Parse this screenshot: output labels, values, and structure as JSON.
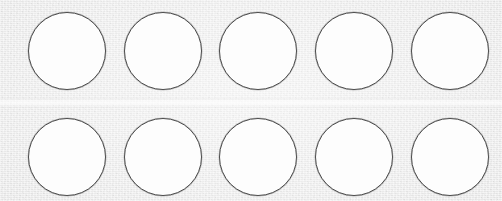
{
  "canvas": {
    "width": 502,
    "height": 201,
    "background_color": "#e2e2e2",
    "medium": "scanned-paper",
    "visible_text": ""
  },
  "sheet": {
    "name": "bubble-grid-sheet",
    "description": "blank answer-sheet bubble grid",
    "rows": 2,
    "columns": 5,
    "bubble_count": 10
  },
  "bubble_style": {
    "diameter": 78,
    "fill_color": "#fdfdfd",
    "stroke_color": "#4c4c4c",
    "stroke_width": 1,
    "filled": false,
    "state": "empty"
  },
  "layout": {
    "column_x": [
      28,
      124,
      219,
      315,
      411
    ],
    "row_y": [
      12,
      118
    ],
    "column_pitch": 96,
    "row_pitch": 106
  },
  "artifacts": {
    "crease": {
      "name": "paper-crease",
      "orientation": "horizontal",
      "y": 98,
      "height": 10
    }
  },
  "grid": {
    "rows": [
      {
        "index": 1,
        "y": 12,
        "bubbles": [
          {
            "id": "r1c1",
            "x": 28,
            "label": "row 1 bubble 1",
            "filled": false
          },
          {
            "id": "r1c2",
            "x": 124,
            "label": "row 1 bubble 2",
            "filled": false
          },
          {
            "id": "r1c3",
            "x": 219,
            "label": "row 1 bubble 3",
            "filled": false
          },
          {
            "id": "r1c4",
            "x": 315,
            "label": "row 1 bubble 4",
            "filled": false
          },
          {
            "id": "r1c5",
            "x": 411,
            "label": "row 1 bubble 5",
            "filled": false
          }
        ]
      },
      {
        "index": 2,
        "y": 118,
        "bubbles": [
          {
            "id": "r2c1",
            "x": 28,
            "label": "row 2 bubble 1",
            "filled": false
          },
          {
            "id": "r2c2",
            "x": 124,
            "label": "row 2 bubble 2",
            "filled": false
          },
          {
            "id": "r2c3",
            "x": 219,
            "label": "row 2 bubble 3",
            "filled": false
          },
          {
            "id": "r2c4",
            "x": 315,
            "label": "row 2 bubble 4",
            "filled": false
          },
          {
            "id": "r2c5",
            "x": 411,
            "label": "row 2 bubble 5",
            "filled": false
          }
        ]
      }
    ]
  }
}
